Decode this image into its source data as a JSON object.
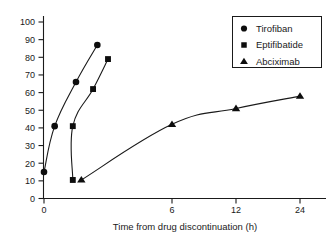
{
  "chart_data": {
    "type": "line",
    "title": "",
    "subtitle": "",
    "xlabel": "Time from drug discontinuation (h)",
    "ylabel": "",
    "xticks": [
      0,
      6,
      12,
      24
    ],
    "xtick_labels": [
      "0",
      "6",
      "12",
      "24"
    ],
    "x_axis_note": "non-linear spacing: equal pixel gaps between 6, 12 and 24",
    "yticks": [
      0,
      10,
      20,
      30,
      40,
      50,
      60,
      70,
      80,
      90,
      100
    ],
    "ytick_labels": [
      "0",
      "10",
      "20",
      "30",
      "40",
      "50",
      "60",
      "70",
      "80",
      "90",
      "100"
    ],
    "ylim": [
      0,
      100
    ],
    "xlim": [
      -0.3,
      27
    ],
    "grid": false,
    "legend_position": "top-right",
    "series": [
      {
        "name": "Tirofiban",
        "marker": "circle",
        "x": [
          0,
          0.5,
          1.5,
          2.5
        ],
        "y": [
          15,
          41,
          66,
          87
        ]
      },
      {
        "name": "Eptifibatide",
        "marker": "square",
        "x": [
          1.35,
          1.35,
          2.3,
          3.0
        ],
        "y": [
          10.5,
          41,
          62,
          79
        ]
      },
      {
        "name": "Abciximab",
        "marker": "triangle",
        "x": [
          1.75,
          6,
          12,
          24
        ],
        "y": [
          10.5,
          42,
          51,
          58
        ]
      }
    ]
  },
  "legend": {
    "entries": [
      {
        "label": "Tirofiban",
        "marker": "circle"
      },
      {
        "label": "Eptifibatide",
        "marker": "square"
      },
      {
        "label": "Abciximab",
        "marker": "triangle"
      }
    ]
  }
}
